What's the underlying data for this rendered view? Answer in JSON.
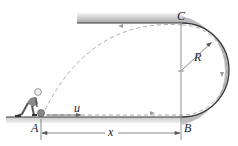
{
  "diagram": {
    "labels": {
      "point_a": "A",
      "point_b": "B",
      "point_c": "C",
      "radius": "R",
      "distance": "x",
      "velocity": "u"
    },
    "colors": {
      "track_dark": "#3a3a3a",
      "track_shade": "#9a9a9a",
      "path_dash": "#a0a0a0",
      "dimension_line": "#555555",
      "background": "#ffffff"
    }
  }
}
